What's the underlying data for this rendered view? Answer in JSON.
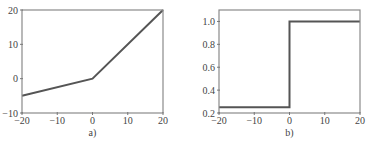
{
  "chart_data": [
    {
      "type": "line",
      "title": "",
      "caption": "a)",
      "xlabel": "",
      "ylabel": "",
      "xlim": [
        -20,
        20
      ],
      "ylim": [
        -10,
        20
      ],
      "xticks": [
        -20,
        -10,
        0,
        10,
        20
      ],
      "xtick_labels": [
        "−20",
        "−10",
        "0",
        "10",
        "20"
      ],
      "yticks": [
        -10,
        0,
        10,
        20
      ],
      "ytick_labels": [
        "−10",
        "0",
        "10",
        "20"
      ],
      "grid": false,
      "legend": null,
      "series": [
        {
          "name": "piecewise linear",
          "x": [
            -20,
            0,
            20
          ],
          "y": [
            -5,
            0,
            20
          ],
          "color": "#555555"
        }
      ]
    },
    {
      "type": "line",
      "title": "",
      "caption": "b)",
      "xlabel": "",
      "ylabel": "",
      "xlim": [
        -20,
        20
      ],
      "ylim": [
        0.2,
        1.1
      ],
      "xticks": [
        -20,
        -10,
        0,
        10,
        20
      ],
      "xtick_labels": [
        "−20",
        "−10",
        "0",
        "10",
        "20"
      ],
      "yticks": [
        0.2,
        0.4,
        0.6,
        0.8,
        1.0
      ],
      "ytick_labels": [
        "0.2",
        "0.4",
        "0.6",
        "0.8",
        "1.0"
      ],
      "grid": false,
      "legend": null,
      "series": [
        {
          "name": "step",
          "x": [
            -20,
            0,
            0,
            20
          ],
          "y": [
            0.25,
            0.25,
            1.0,
            1.0
          ],
          "color": "#555555"
        }
      ]
    }
  ]
}
